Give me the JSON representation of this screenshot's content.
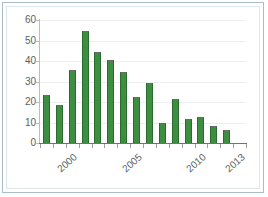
{
  "chart_data": {
    "type": "bar",
    "title": "",
    "subtitle": "",
    "xlabel": "",
    "ylabel": "",
    "categories": [
      "1998",
      "1999",
      "2000",
      "2001",
      "2002",
      "2003",
      "2004",
      "2005",
      "2006",
      "2007",
      "2008",
      "2009",
      "2010",
      "2011",
      "2012",
      "2013"
    ],
    "values": [
      23.5,
      18.5,
      35.5,
      54.5,
      44.5,
      40.5,
      34.5,
      22.5,
      29.5,
      10.0,
      21.5,
      11.5,
      12.5,
      8.5,
      6.5,
      0
    ],
    "series": [
      {
        "name": "series-1",
        "values": [
          23.5,
          18.5,
          35.5,
          54.5,
          44.5,
          40.5,
          34.5,
          22.5,
          29.5,
          10.0,
          21.5,
          11.5,
          12.5,
          8.5,
          6.5,
          0
        ]
      }
    ],
    "ylim": [
      0,
      60
    ],
    "yticks": [
      0,
      10,
      20,
      30,
      40,
      50,
      60
    ],
    "ytick_labels": [
      "0",
      "10",
      "20",
      "30",
      "40",
      "50",
      "60"
    ],
    "xtick_labels": [
      "2000",
      "2005",
      "2010",
      "2013"
    ],
    "xtick_categories": [
      "2000",
      "2005",
      "2010",
      "2013"
    ],
    "grid": true,
    "grid_axis": "y",
    "legend": false,
    "legend_position": "none",
    "bar_color": "#3e8e41",
    "bar_edge_color": "#2c6b2f",
    "gridline_color": "#eceef0",
    "axis_color": "#6f7276",
    "tick_label_color": "#5a5f63",
    "background_color": "#ffffff",
    "frame_color": "#a8bfc6"
  }
}
